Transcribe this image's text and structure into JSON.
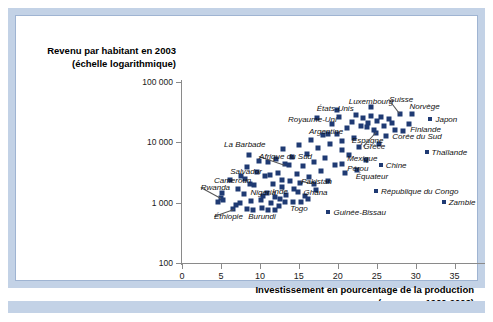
{
  "frame": {
    "accent_color": "#c3d2e6",
    "panel_border_color": "#9fb4d2",
    "marker_color": "#1f3a73",
    "axis_color": "#8a8a8a"
  },
  "chart_data": {
    "type": "scatter",
    "title": "",
    "ylabel_line1": "Revenu par habitant en 2003",
    "ylabel_line2": "(échelle logarithmique)",
    "xlabel_line1": "Investissement en pourcentage de la production",
    "xlabel_line2": "(moyenne 1960-2003)",
    "yscale": "log",
    "ylim": [
      100,
      100000
    ],
    "yticks": [
      100,
      1000,
      10000,
      100000
    ],
    "ytick_labels": [
      "100",
      "1 000",
      "10 000",
      "100 000"
    ],
    "xlim": [
      0,
      38
    ],
    "xticks": [
      0,
      5,
      10,
      15,
      20,
      25,
      30,
      35
    ],
    "xtick_labels": [
      "0",
      "5",
      "10",
      "15",
      "20",
      "25",
      "30",
      "35"
    ],
    "grid": false,
    "legend": "none",
    "labeled_points": [
      {
        "name": "La Barbade",
        "x": 8.6,
        "y": 6200,
        "lx": 5.4,
        "ly": 9400,
        "align": "left"
      },
      {
        "name": "Afrique du Sud",
        "x": 13.2,
        "y": 4300,
        "lx": 9.9,
        "ly": 6000,
        "align": "left",
        "leader": true
      },
      {
        "name": "Salvador",
        "x": 11.3,
        "y": 2850,
        "lx": 6.2,
        "ly": 3300,
        "align": "left"
      },
      {
        "name": "Cameroun",
        "x": 8.7,
        "y": 2050,
        "lx": 4.1,
        "ly": 2350,
        "align": "left"
      },
      {
        "name": "Rwanda",
        "x": 5.0,
        "y": 1180,
        "lx": 2.4,
        "ly": 1800,
        "align": "left",
        "leader": true
      },
      {
        "name": "Éthiopie",
        "x": 6.6,
        "y": 790,
        "lx": 4.1,
        "ly": 610,
        "align": "left",
        "leader": true
      },
      {
        "name": "Burundi",
        "x": 8.3,
        "y": 790,
        "lx": 8.5,
        "ly": 610,
        "align": "left"
      },
      {
        "name": "Nigeria",
        "x": 10.4,
        "y": 1270,
        "lx": 8.8,
        "ly": 1500,
        "align": "left"
      },
      {
        "name": "Inde",
        "x": 12.9,
        "y": 1800,
        "lx": 11.6,
        "ly": 1550,
        "align": "left"
      },
      {
        "name": "Togo",
        "x": 14.2,
        "y": 1020,
        "lx": 13.9,
        "ly": 830,
        "align": "left"
      },
      {
        "name": "Ghana",
        "x": 14.9,
        "y": 1520,
        "lx": 15.6,
        "ly": 1520,
        "align": "left"
      },
      {
        "name": "Guinée-Bissau",
        "x": 18.0,
        "y": 700,
        "lx": 18.8,
        "ly": 700,
        "align": "left",
        "legend": true
      },
      {
        "name": "Pakistan",
        "x": 17.0,
        "y": 2050,
        "lx": 15.3,
        "ly": 2250,
        "align": "left",
        "leader": true
      },
      {
        "name": "Royaume-Uni",
        "x": 17.3,
        "y": 25000,
        "lx": 13.6,
        "ly": 24000,
        "align": "left"
      },
      {
        "name": "Argentine",
        "x": 18.8,
        "y": 13500,
        "lx": 16.3,
        "ly": 15500,
        "align": "left"
      },
      {
        "name": "États-Unis",
        "x": 19.9,
        "y": 34000,
        "lx": 17.3,
        "ly": 37000,
        "align": "left"
      },
      {
        "name": "Mexique",
        "x": 20.5,
        "y": 7600,
        "lx": 21.2,
        "ly": 5400,
        "align": "left"
      },
      {
        "name": "Pérou",
        "x": 20.5,
        "y": 4400,
        "lx": 21.2,
        "ly": 3700,
        "align": "left"
      },
      {
        "name": "Équateur",
        "x": 22.5,
        "y": 3500,
        "lx": 22.3,
        "ly": 2750,
        "align": "left"
      },
      {
        "name": "Chine",
        "x": 24.7,
        "y": 4200,
        "lx": 25.5,
        "ly": 4200,
        "align": "left",
        "legend": true
      },
      {
        "name": "Espagne",
        "x": 23.7,
        "y": 18000,
        "lx": 21.8,
        "ly": 11000,
        "align": "left"
      },
      {
        "name": "Grèce",
        "x": 24.9,
        "y": 14500,
        "lx": 23.3,
        "ly": 8600,
        "align": "left",
        "leader": true
      },
      {
        "name": "Luxembourg",
        "x": 24.3,
        "y": 39000,
        "lx": 21.4,
        "ly": 48000,
        "align": "left"
      },
      {
        "name": "Suisse",
        "x": 28.0,
        "y": 30000,
        "lx": 26.6,
        "ly": 52000,
        "align": "left",
        "leader": true
      },
      {
        "name": "Norvège",
        "x": 29.5,
        "y": 30000,
        "lx": 29.2,
        "ly": 40000,
        "align": "left"
      },
      {
        "name": "Japon",
        "x": 31.3,
        "y": 24000,
        "lx": 31.9,
        "ly": 24000,
        "align": "left",
        "legend": true
      },
      {
        "name": "Finlande",
        "x": 29.1,
        "y": 20000,
        "lx": 29.3,
        "ly": 16500,
        "align": "left"
      },
      {
        "name": "Corée du Sud",
        "x": 28.4,
        "y": 15500,
        "lx": 27.0,
        "ly": 12800,
        "align": "left"
      },
      {
        "name": "Thaïlande",
        "x": 30.5,
        "y": 6900,
        "lx": 31.4,
        "ly": 6900,
        "align": "left",
        "legend": true
      },
      {
        "name": "République du Congo",
        "x": 24.0,
        "y": 1550,
        "lx": 24.9,
        "ly": 1550,
        "align": "left",
        "legend": true
      },
      {
        "name": "Zambie",
        "x": 32.7,
        "y": 1020,
        "lx": 33.6,
        "ly": 1020,
        "align": "left",
        "legend": true
      }
    ],
    "unlabeled_points": [
      {
        "x": 4.6,
        "y": 1020
      },
      {
        "x": 5.3,
        "y": 1100
      },
      {
        "x": 5.1,
        "y": 1450
      },
      {
        "x": 6.1,
        "y": 2400
      },
      {
        "x": 6.9,
        "y": 900
      },
      {
        "x": 7.4,
        "y": 980
      },
      {
        "x": 7.2,
        "y": 1700
      },
      {
        "x": 7.9,
        "y": 1380
      },
      {
        "x": 8.1,
        "y": 2500
      },
      {
        "x": 8.9,
        "y": 1050
      },
      {
        "x": 9.3,
        "y": 1950
      },
      {
        "x": 9.6,
        "y": 3200
      },
      {
        "x": 9.9,
        "y": 4900
      },
      {
        "x": 10.1,
        "y": 1100
      },
      {
        "x": 10.6,
        "y": 2800
      },
      {
        "x": 10.9,
        "y": 1450
      },
      {
        "x": 11.1,
        "y": 4800
      },
      {
        "x": 11.4,
        "y": 980
      },
      {
        "x": 11.7,
        "y": 2050
      },
      {
        "x": 11.9,
        "y": 1220
      },
      {
        "x": 12.1,
        "y": 5200
      },
      {
        "x": 12.3,
        "y": 3100
      },
      {
        "x": 12.6,
        "y": 1150
      },
      {
        "x": 12.8,
        "y": 2400
      },
      {
        "x": 13.0,
        "y": 7800
      },
      {
        "x": 13.4,
        "y": 1350
      },
      {
        "x": 13.7,
        "y": 4200
      },
      {
        "x": 13.9,
        "y": 2250
      },
      {
        "x": 14.1,
        "y": 5800
      },
      {
        "x": 14.4,
        "y": 1700
      },
      {
        "x": 14.7,
        "y": 3000
      },
      {
        "x": 15.0,
        "y": 9000
      },
      {
        "x": 15.2,
        "y": 2100
      },
      {
        "x": 15.5,
        "y": 4000
      },
      {
        "x": 15.8,
        "y": 1300
      },
      {
        "x": 16.0,
        "y": 6500
      },
      {
        "x": 16.3,
        "y": 2700
      },
      {
        "x": 16.6,
        "y": 11000
      },
      {
        "x": 16.9,
        "y": 4800
      },
      {
        "x": 17.2,
        "y": 1600
      },
      {
        "x": 17.5,
        "y": 8200
      },
      {
        "x": 17.8,
        "y": 3300
      },
      {
        "x": 18.1,
        "y": 13000
      },
      {
        "x": 18.4,
        "y": 5500
      },
      {
        "x": 18.7,
        "y": 2300
      },
      {
        "x": 19.0,
        "y": 9500
      },
      {
        "x": 19.3,
        "y": 20000
      },
      {
        "x": 19.6,
        "y": 4200
      },
      {
        "x": 19.9,
        "y": 14000
      },
      {
        "x": 20.2,
        "y": 26000
      },
      {
        "x": 20.6,
        "y": 10500
      },
      {
        "x": 20.9,
        "y": 3100
      },
      {
        "x": 21.2,
        "y": 17000
      },
      {
        "x": 21.5,
        "y": 6200
      },
      {
        "x": 21.8,
        "y": 22000
      },
      {
        "x": 22.1,
        "y": 12000
      },
      {
        "x": 22.4,
        "y": 28000
      },
      {
        "x": 22.7,
        "y": 8500
      },
      {
        "x": 23.0,
        "y": 19000
      },
      {
        "x": 23.3,
        "y": 25000
      },
      {
        "x": 23.6,
        "y": 5000
      },
      {
        "x": 23.9,
        "y": 21000
      },
      {
        "x": 24.2,
        "y": 27000
      },
      {
        "x": 24.6,
        "y": 16000
      },
      {
        "x": 25.0,
        "y": 23000
      },
      {
        "x": 25.3,
        "y": 9500
      },
      {
        "x": 25.6,
        "y": 26000
      },
      {
        "x": 25.9,
        "y": 18500
      },
      {
        "x": 26.2,
        "y": 12500
      },
      {
        "x": 26.6,
        "y": 24000
      },
      {
        "x": 27.0,
        "y": 21000
      },
      {
        "x": 27.4,
        "y": 16000
      },
      {
        "x": 12.0,
        "y": 760
      },
      {
        "x": 12.5,
        "y": 880
      },
      {
        "x": 11.0,
        "y": 760
      },
      {
        "x": 10.3,
        "y": 830
      },
      {
        "x": 9.1,
        "y": 760
      },
      {
        "x": 16.2,
        "y": 1150
      },
      {
        "x": 15.3,
        "y": 1020
      },
      {
        "x": 13.2,
        "y": 1020
      },
      {
        "x": 8.4,
        "y": 3900
      },
      {
        "x": 7.6,
        "y": 2750
      }
    ]
  }
}
